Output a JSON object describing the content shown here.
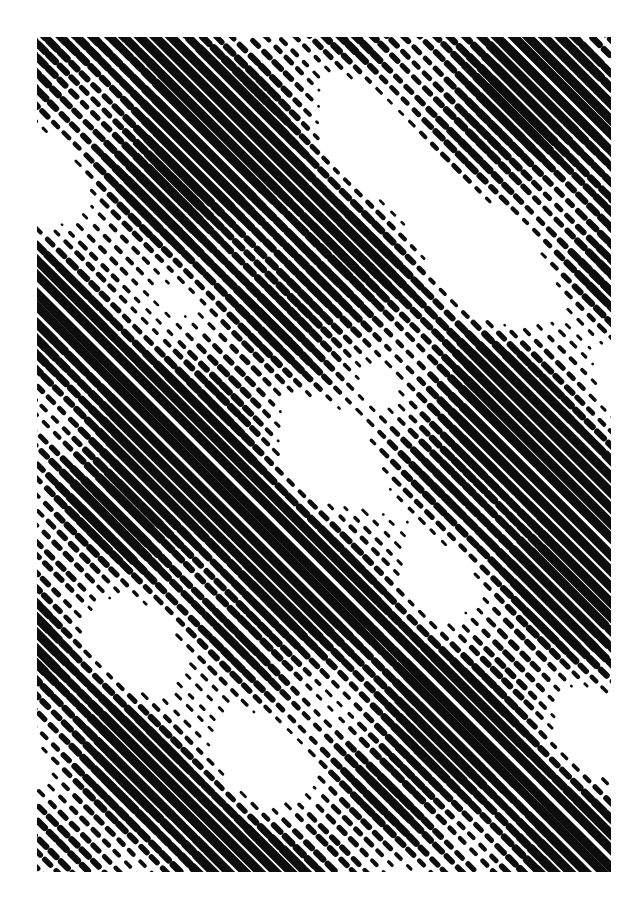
{
  "page": {
    "width": 639,
    "height": 904,
    "background_color": "#ffffff"
  },
  "artwork": {
    "name": "diagonal-halftone-line-screen",
    "frame": {
      "x": 37,
      "y": 37,
      "width": 574,
      "height": 835
    },
    "ink_color": "#0d0d0d",
    "paper_color": "#ffffff",
    "medium": "bitmap halftone, diagonal line screen",
    "description": "Abstract black-and-white field of parallel rounded-cap diagonal strokes running from upper-left to lower-right at roughly 45 degrees. Stroke weight swells and thins so that broad light and dark bands emerge on the perpendicular diagonal, producing a woven plaid-like moire."
  },
  "chart_data": {
    "type": "heatmap",
    "xlabel": "",
    "ylabel": "",
    "grid": false,
    "legend": "none",
    "screen": {
      "angle_deg": 45,
      "line_period_px": 11.0,
      "max_stroke_px": 9.2,
      "min_stroke_px": 0.0,
      "dash_period_px": 15.5,
      "cap": "round",
      "jitter_px": 2.1,
      "dash_jitter_px": 5.0
    },
    "tone_field": {
      "description": "Underlying grayscale tone sampled by the screen. 0 = paper white, 1 = solid ink. Built from crossing diagonal sine waves plus low-frequency blobs.",
      "range": [
        0,
        1
      ],
      "mean_coverage": 0.52,
      "waves": [
        {
          "name": "primary-antidiagonal-band",
          "amplitude": 0.34,
          "wavelength_px": 252,
          "angle_deg": -45,
          "phase_deg": 18
        },
        {
          "name": "secondary-antidiagonal-band",
          "amplitude": 0.19,
          "wavelength_px": 131,
          "angle_deg": -45,
          "phase_deg": 205
        },
        {
          "name": "cross-diagonal-band",
          "amplitude": 0.17,
          "wavelength_px": 196,
          "angle_deg": 45,
          "phase_deg": 96
        },
        {
          "name": "horizontal-drift",
          "amplitude": 0.1,
          "wavelength_px": 340,
          "angle_deg": 0,
          "phase_deg": 250
        },
        {
          "name": "vertical-drift",
          "amplitude": 0.09,
          "wavelength_px": 415,
          "angle_deg": 90,
          "phase_deg": 40
        },
        {
          "name": "fine-texture",
          "amplitude": 0.07,
          "wavelength_px": 64,
          "angle_deg": -45,
          "phase_deg": 310
        }
      ],
      "blobs": [
        {
          "name": "dark-blob-upper-left",
          "cx": 150,
          "cy": 250,
          "radius_px": 120,
          "weight": 0.22
        },
        {
          "name": "light-blob-upper-right",
          "cx": 430,
          "cy": 175,
          "radius_px": 130,
          "weight": -0.26
        },
        {
          "name": "dark-blob-mid-left",
          "cx": 95,
          "cy": 470,
          "radius_px": 115,
          "weight": 0.2
        },
        {
          "name": "light-blob-center",
          "cx": 330,
          "cy": 430,
          "radius_px": 105,
          "weight": -0.2
        },
        {
          "name": "dark-blob-mid-right",
          "cx": 505,
          "cy": 530,
          "radius_px": 125,
          "weight": 0.21
        },
        {
          "name": "light-blob-lower-left",
          "cx": 160,
          "cy": 700,
          "radius_px": 110,
          "weight": -0.18
        },
        {
          "name": "dark-blob-lower-center",
          "cx": 360,
          "cy": 745,
          "radius_px": 120,
          "weight": 0.19
        },
        {
          "name": "light-blob-lower-right",
          "cx": 520,
          "cy": 800,
          "radius_px": 100,
          "weight": -0.15
        }
      ],
      "samples": {
        "note": "Estimated ink coverage fraction on a coarse grid across the framed artwork, read left-to-right then top-to-bottom.",
        "grid_cols": 8,
        "grid_rows": 11,
        "values": [
          [
            0.62,
            0.55,
            0.34,
            0.3,
            0.58,
            0.66,
            0.4,
            0.52
          ],
          [
            0.7,
            0.6,
            0.28,
            0.36,
            0.66,
            0.72,
            0.46,
            0.58
          ],
          [
            0.58,
            0.68,
            0.45,
            0.52,
            0.7,
            0.55,
            0.34,
            0.64
          ],
          [
            0.45,
            0.72,
            0.62,
            0.6,
            0.5,
            0.33,
            0.42,
            0.7
          ],
          [
            0.38,
            0.64,
            0.7,
            0.55,
            0.36,
            0.4,
            0.62,
            0.66
          ],
          [
            0.52,
            0.48,
            0.66,
            0.44,
            0.32,
            0.58,
            0.7,
            0.54
          ],
          [
            0.66,
            0.36,
            0.5,
            0.38,
            0.48,
            0.68,
            0.6,
            0.4
          ],
          [
            0.7,
            0.44,
            0.34,
            0.52,
            0.64,
            0.62,
            0.42,
            0.36
          ],
          [
            0.58,
            0.62,
            0.4,
            0.66,
            0.7,
            0.46,
            0.34,
            0.5
          ],
          [
            0.44,
            0.7,
            0.56,
            0.72,
            0.54,
            0.35,
            0.48,
            0.64
          ],
          [
            0.5,
            0.66,
            0.68,
            0.58,
            0.38,
            0.46,
            0.62,
            0.6
          ]
        ]
      }
    }
  }
}
